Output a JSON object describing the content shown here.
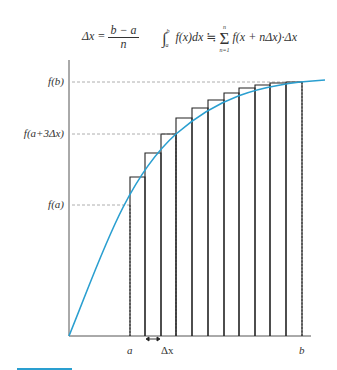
{
  "formulas": {
    "delta_x": {
      "lhs": "Δx =",
      "numerator": "b − a",
      "denominator": "n"
    },
    "riemann": {
      "integral": "∫",
      "upper": "b",
      "lower": "a",
      "integrand": "f(x)dx ≒",
      "sum_top": "n",
      "sum_bottom": "n=1",
      "sigma": "Σ",
      "summand": "f(x + nΔx)·Δx"
    }
  },
  "y_labels": {
    "fb": "f(b)",
    "fa3": "f(a+3Δx)",
    "fa": "f(a)"
  },
  "x_labels": {
    "a": "a",
    "dx": "Δx",
    "b": "b"
  },
  "colors": {
    "curve": "#2a9fd0",
    "bars": "#222222",
    "axes": "#555555",
    "guides": "#999999"
  },
  "chart_data": {
    "type": "bar",
    "xlabel": "",
    "ylabel": "",
    "x_ticks": [
      "a",
      "Δx",
      "b"
    ],
    "y_ticks": [
      "f(a)",
      "f(a+3Δx)",
      "f(b)"
    ],
    "n_rectangles": 11,
    "bar_left_px": [
      130,
      145,
      161,
      176,
      192,
      208,
      224,
      239,
      255,
      270,
      286
    ],
    "bar_top_px": [
      177,
      153,
      134,
      118,
      108,
      100,
      93,
      88,
      85,
      83,
      82
    ],
    "curve": "concave increasing curve from origin to beyond b",
    "grid": false
  }
}
